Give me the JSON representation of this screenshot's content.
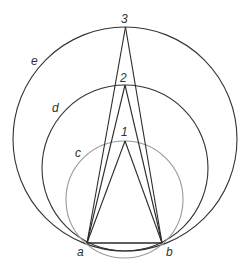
{
  "diagram": {
    "points": {
      "a": {
        "label": "a",
        "x": 87,
        "y": 243
      },
      "b": {
        "label": "b",
        "x": 162,
        "y": 243
      },
      "apex1": {
        "label": "1",
        "x": 125,
        "y": 141
      },
      "apex2": {
        "label": "2",
        "x": 125,
        "y": 85
      },
      "apex3": {
        "label": "3",
        "x": 125.5,
        "y": 27
      }
    },
    "circles": {
      "c": {
        "label": "c",
        "cx": 124.5,
        "cy": 199.5,
        "r": 58.5,
        "color": "#9a9a9a"
      },
      "d": {
        "label": "d",
        "cx": 125,
        "cy": 168,
        "r": 83,
        "color": "#333333"
      },
      "e": {
        "label": "e",
        "cx": 125,
        "cy": 139,
        "r": 112,
        "color": "#333333"
      }
    },
    "line_color": "#2a2a2a"
  }
}
